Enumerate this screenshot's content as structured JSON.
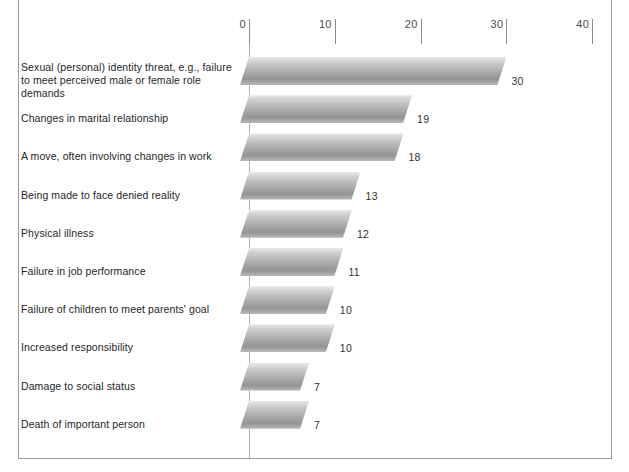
{
  "chart_data": {
    "type": "bar",
    "orientation": "horizontal",
    "title": "",
    "xlabel": "",
    "ylabel": "",
    "xlim": [
      0,
      40
    ],
    "grid": false,
    "legend": null,
    "tick_labels": [
      "0",
      "10",
      "20",
      "30",
      "40"
    ],
    "tick_values": [
      0,
      10,
      20,
      30,
      40
    ],
    "categories": [
      "Sexual (personal) identity threat, e.g., failure to meet perceived male or female role demands",
      "Changes in marital relationship",
      "A move, often involving changes in work",
      "Being made to face denied reality",
      "Physical illness",
      "Failure in job performance",
      "Failure of children to meet parents' goal",
      "Increased responsibility",
      "Damage to social status",
      "Death of important person"
    ],
    "values": [
      30,
      19,
      18,
      13,
      12,
      11,
      10,
      10,
      7,
      7
    ],
    "bar_color_light": "#e9e9e9",
    "bar_color_dark": "#949494",
    "axis_color": "#b4b4b4"
  },
  "rows": [
    {
      "label_line1": "Sexual (personal) identity threat, e.g., failure",
      "label_line2": "to meet perceived male or female role demands",
      "value": 30,
      "value_text": "30"
    },
    {
      "label_line1": "Changes in marital relationship",
      "label_line2": "",
      "value": 19,
      "value_text": "19"
    },
    {
      "label_line1": "A move, often involving changes in work",
      "label_line2": "",
      "value": 18,
      "value_text": "18"
    },
    {
      "label_line1": "Being made to face denied reality",
      "label_line2": "",
      "value": 13,
      "value_text": "13"
    },
    {
      "label_line1": "Physical illness",
      "label_line2": "",
      "value": 12,
      "value_text": "12"
    },
    {
      "label_line1": "Failure in job performance",
      "label_line2": "",
      "value": 11,
      "value_text": "11"
    },
    {
      "label_line1": "Failure of children to meet parents' goal",
      "label_line2": "",
      "value": 10,
      "value_text": "10"
    },
    {
      "label_line1": "Increased responsibility",
      "label_line2": "",
      "value": 10,
      "value_text": "10"
    },
    {
      "label_line1": "Damage to social status",
      "label_line2": "",
      "value": 7,
      "value_text": "7"
    },
    {
      "label_line1": "Death of important person",
      "label_line2": "",
      "value": 7,
      "value_text": "7"
    }
  ],
  "axis": {
    "ticks": [
      {
        "label": "0",
        "value": 0
      },
      {
        "label": "10",
        "value": 10
      },
      {
        "label": "20",
        "value": 20
      },
      {
        "label": "30",
        "value": 30
      },
      {
        "label": "40",
        "value": 40
      }
    ]
  }
}
